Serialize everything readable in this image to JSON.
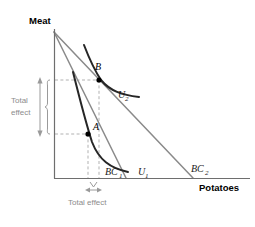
{
  "figure": {
    "type": "economics-indifference-curve-diagram",
    "axes": {
      "y_label": "Meat",
      "x_label": "Potatoes"
    },
    "budget_lines": [
      {
        "id": "bc1",
        "label": "BC",
        "subscript": "1"
      },
      {
        "id": "bc2",
        "label": "BC",
        "subscript": "2"
      }
    ],
    "indifference_curves": [
      {
        "id": "u1",
        "label": "U",
        "subscript": "1"
      },
      {
        "id": "u2",
        "label": "U",
        "subscript": "2"
      }
    ],
    "points": [
      {
        "id": "a",
        "label": "A"
      },
      {
        "id": "b",
        "label": "B"
      }
    ],
    "annotations": {
      "vertical_effect_line1": "Total",
      "vertical_effect_line2": "effect",
      "horizontal_effect": "Total effect"
    },
    "colors": {
      "axis": "#6e6e6e",
      "budget_line": "#8a8a8a",
      "indifference_curve": "#262626",
      "guide": "#a8a8a8",
      "annotation": "#9a9a9a",
      "text": "#000000"
    }
  }
}
